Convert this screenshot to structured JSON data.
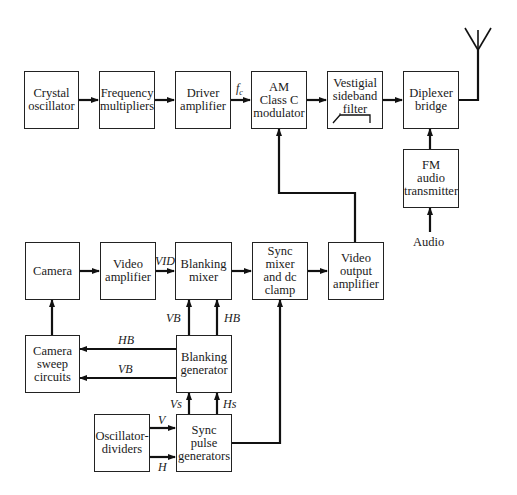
{
  "diagram": {
    "type": "block-diagram",
    "title": "",
    "blocks": {
      "crystal_oscillator": "Crystal\noscillator",
      "frequency_multipliers": "Frequency\nmultipliers",
      "driver_amplifier": "Driver\namplifier",
      "am_modulator": "AM\nClass C\nmodulator",
      "vsb_filter": "Vestigial\nsideband\nfilter",
      "diplexer_bridge": "Diplexer\nbridge",
      "fm_audio_transmitter": "FM\naudio\ntransmitter",
      "camera": "Camera",
      "video_amplifier": "Video\namplifier",
      "blanking_mixer": "Blanking\nmixer",
      "sync_mixer": "Sync mixer\nand dc\nclamp",
      "video_output_amplifier": "Video\noutput\namplifier",
      "camera_sweep": "Camera\nsweep\ncircuits",
      "blanking_generator": "Blanking\ngenerator",
      "oscillator_dividers": "Oscillator-\ndividers",
      "sync_pulse_generators": "Sync\npulse\ngenerators"
    },
    "signal_labels": {
      "fc": "f",
      "fc_sub": "c",
      "vid": "VID",
      "vb_up": "VB",
      "hb_up": "HB",
      "hb_left": "HB",
      "vb_left": "VB",
      "vs": "Vs",
      "hs": "Hs",
      "v": "V",
      "h": "H"
    },
    "inputs": {
      "audio": "Audio"
    },
    "icons": {
      "antenna": "antenna-icon",
      "filter_response": "filter-response-icon"
    }
  }
}
